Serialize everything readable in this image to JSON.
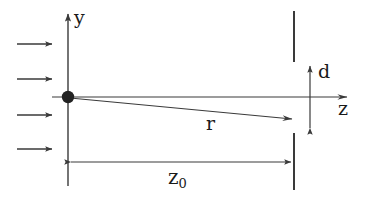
{
  "figure": {
    "kind": "physics-optics-diagram",
    "width": 367,
    "height": 198,
    "background_color": "#ffffff",
    "line_color": "#3a3a3a",
    "label_color": "#1a1a1a"
  },
  "labels": {
    "y_axis": "y",
    "z_axis": "z",
    "transverse_offset": "d",
    "ray": "r",
    "axial_distance": "z",
    "axial_distance_subscript": "0"
  },
  "geometry": {
    "origin": {
      "x": 68,
      "y": 97
    },
    "y_axis": {
      "x": 68,
      "y_top": 12,
      "y_bottom": 186,
      "arrow_at": "top"
    },
    "z_axis": {
      "y": 97,
      "x_left": 52,
      "x_right": 350,
      "arrow_at": "right"
    },
    "scatterer_dot": {
      "cx": 68,
      "cy": 97,
      "r": 6
    },
    "incoming_wave_arrows": [
      {
        "x1": 17,
        "x2": 54,
        "y": 44
      },
      {
        "x1": 17,
        "x2": 54,
        "y": 79
      },
      {
        "x1": 17,
        "x2": 54,
        "y": 115
      },
      {
        "x1": 17,
        "x2": 54,
        "y": 149
      }
    ],
    "screen_bar_upper": {
      "x": 294,
      "y_top": 11,
      "y_bottom": 62
    },
    "screen_bar_lower": {
      "x": 294,
      "y_top": 133,
      "y_bottom": 190
    },
    "ray_line": {
      "x1": 68,
      "y1": 97,
      "x2": 295,
      "y2": 119,
      "arrow_at": "end"
    },
    "d_dimension": {
      "x": 310,
      "y_top": 65,
      "y_bottom": 129,
      "arrows": "both"
    },
    "z0_dimension": {
      "y": 162,
      "x_left": 69,
      "x_right": 293,
      "arrows": "both"
    }
  }
}
